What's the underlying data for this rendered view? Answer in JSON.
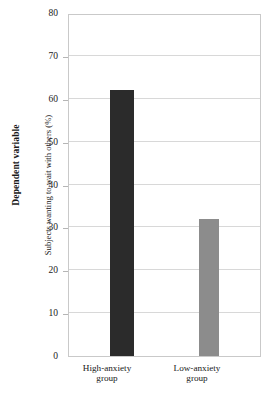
{
  "chart_data": {
    "type": "bar",
    "title": "",
    "categories": [
      "High-anxiety group",
      "Low-anxiety group"
    ],
    "category_lines": [
      [
        "High-anxiety",
        "group"
      ],
      [
        "Low-anxiety",
        "group"
      ]
    ],
    "values": [
      62,
      32
    ],
    "xlabel": "",
    "ylabel": "Subjects wanting to wait with others (%)",
    "outer_ylabel": "Dependent variable",
    "ylim": [
      0,
      80
    ],
    "ytick_labels": [
      "0",
      "10",
      "20",
      "30",
      "40",
      "50",
      "60",
      "70",
      "80"
    ],
    "ytick_values": [
      0,
      10,
      20,
      30,
      40,
      50,
      60,
      70,
      80
    ],
    "grid": true,
    "legend": "none",
    "bar_colors": [
      "#2b2b2b",
      "#8c8c8c"
    ],
    "frame_color": "#c9c9c9",
    "gridline_color": "#d8d8d8"
  }
}
